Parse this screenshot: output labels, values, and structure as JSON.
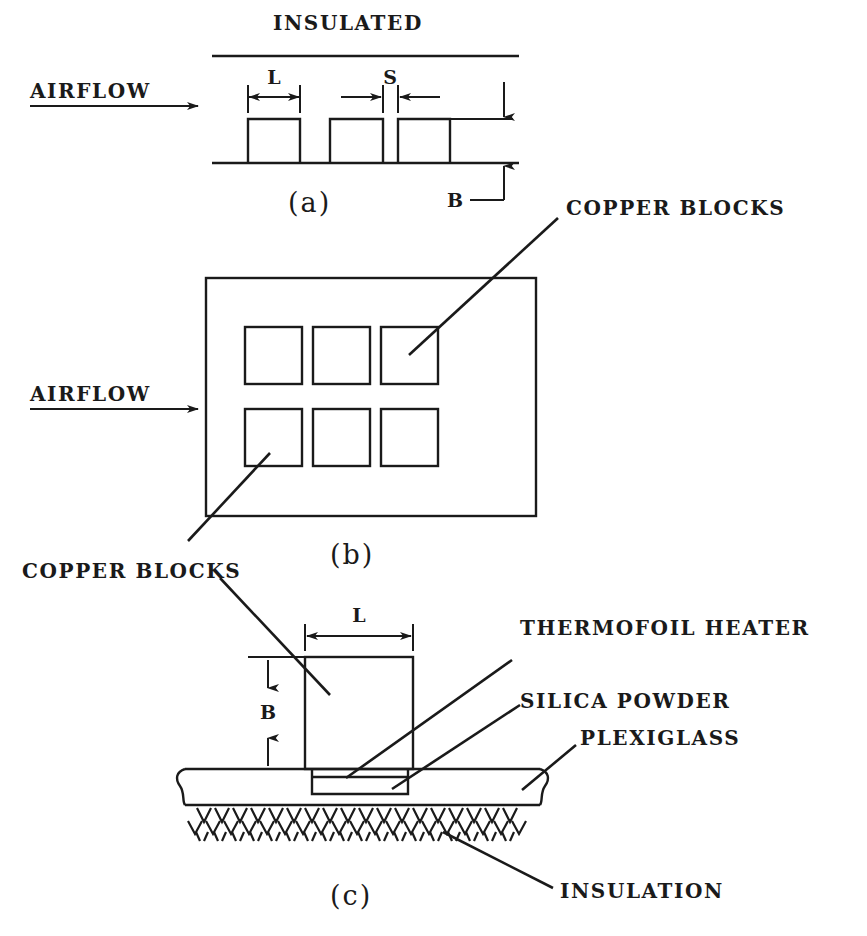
{
  "figure": {
    "title_label": "INSULATED",
    "panels": [
      {
        "id": "a",
        "caption": "(a)",
        "flow_label": "AIRFLOW",
        "dimensions": [
          "L",
          "S",
          "B"
        ],
        "block_count": 3,
        "description": "side view of three copper blocks on a wall with insulated top boundary"
      },
      {
        "id": "b",
        "caption": "(b)",
        "flow_label": "AIRFLOW",
        "block_rows": 2,
        "block_cols": 3,
        "callout_top": "COPPER BLOCKS",
        "callout_bottom": "COPPER BLOCKS",
        "description": "plan view of a 3 by 2 array of copper blocks on a plate"
      },
      {
        "id": "c",
        "caption": "(c)",
        "dimensions": [
          "L",
          "B"
        ],
        "callout_block": "COPPER BLOCKS",
        "callout_heater": "THERMOFOIL HEATER",
        "callout_powder": "SILICA POWDER",
        "callout_plexiglass": "PLEXIGLASS",
        "callout_insulation": "INSULATION",
        "description": "detailed cross section of one copper block mounted on plexiglass with heater, silica powder and insulation"
      }
    ],
    "labels": {
      "insulated": "INSULATED",
      "airflow_a": "AIRFLOW",
      "airflow_b": "AIRFLOW",
      "copper_blocks_b_top": "COPPER BLOCKS",
      "copper_blocks_b_bottom": "COPPER BLOCKS",
      "thermofoil_heater": "THERMOFOIL HEATER",
      "silica_powder": "SILICA POWDER",
      "plexiglass": "PLEXIGLASS",
      "insulation": "INSULATION",
      "dim_L_a": "L",
      "dim_S_a": "S",
      "dim_B_a": "B",
      "dim_L_c": "L",
      "dim_B_c": "B",
      "caption_a": "(a)",
      "caption_b": "(b)",
      "caption_c": "(c)"
    },
    "colors": {
      "ink": "#1a1a1a",
      "background": "#ffffff"
    }
  }
}
